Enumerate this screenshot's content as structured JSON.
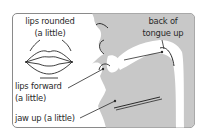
{
  "diagram": {
    "colors": {
      "frame_border": "#8a8a8a",
      "profile_fill": "#c8c8c8",
      "line": "#2a2a2a",
      "background": "#ffffff"
    },
    "labels": {
      "lips_rounded_line1": "lips rounded",
      "lips_rounded_line2": "(a little)",
      "back_of_tongue_line1": "back of",
      "back_of_tongue_line2": "tongue up",
      "lips_forward_line1": "lips forward",
      "lips_forward_line2": "(a little)",
      "jaw_up": "jaw up (a little)"
    },
    "icons": [
      "lips-front-view-icon",
      "head-profile-icon"
    ]
  }
}
